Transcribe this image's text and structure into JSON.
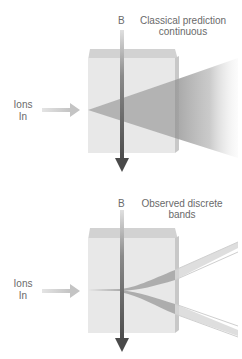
{
  "panels": [
    {
      "id": "classical",
      "field_label": "B",
      "caption_line1": "Classical prediction",
      "caption_line2": "continuous",
      "input_label_line1": "Ions",
      "input_label_line2": "In",
      "outcome": "continuous spread"
    },
    {
      "id": "observed",
      "field_label": "B",
      "caption_line1": "Observed discrete",
      "caption_line2": "bands",
      "input_label_line1": "Ions",
      "input_label_line2": "In",
      "outcome": "two discrete bands"
    }
  ],
  "colors": {
    "box_front": "#e6e6e6",
    "box_top": "#cfcfcf",
    "box_side": "#c4c4c4",
    "beam": "#a8a8a8",
    "field_arrow": "#555555",
    "ions_arrow": "#c8c8c8",
    "text": "#6a6a6a"
  }
}
